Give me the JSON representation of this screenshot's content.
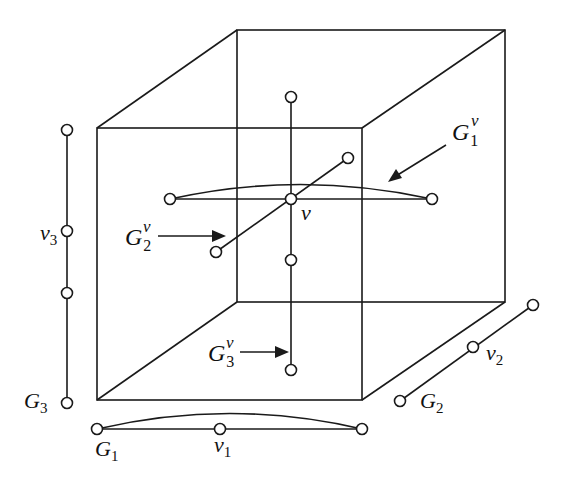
{
  "diagram": {
    "colors": {
      "stroke": "#1a1a1a",
      "node_fill": "#ffffff",
      "background": "#ffffff"
    },
    "cube": {
      "front_face": [
        [
          97,
          128
        ],
        [
          362,
          128
        ],
        [
          362,
          400
        ],
        [
          97,
          400
        ]
      ],
      "back_face": [
        [
          237,
          30
        ],
        [
          505,
          30
        ],
        [
          505,
          302
        ],
        [
          237,
          302
        ]
      ]
    },
    "labels": {
      "G1": {
        "main": "G",
        "sub": "1"
      },
      "G2": {
        "main": "G",
        "sub": "2"
      },
      "G3": {
        "main": "G",
        "sub": "3"
      },
      "v1": {
        "main": "v",
        "sub": "1"
      },
      "v2": {
        "main": "v",
        "sub": "2"
      },
      "v3": {
        "main": "v",
        "sub": "3"
      },
      "v": "v",
      "G1v": {
        "main": "G",
        "sub": "1",
        "sup": "v"
      },
      "G2v": {
        "main": "G",
        "sub": "2",
        "sup": "v"
      },
      "G3v": {
        "main": "G",
        "sub": "3",
        "sup": "v"
      }
    },
    "factor_graphs": {
      "G1": {
        "orientation": "horizontal",
        "nodes": 3,
        "distinguished": "v1"
      },
      "G2": {
        "orientation": "diagonal",
        "nodes": 3,
        "distinguished": "v2"
      },
      "G3": {
        "orientation": "vertical",
        "nodes": 4,
        "distinguished": "v3"
      }
    },
    "fibers": [
      "G1^v",
      "G2^v",
      "G3^v"
    ]
  }
}
